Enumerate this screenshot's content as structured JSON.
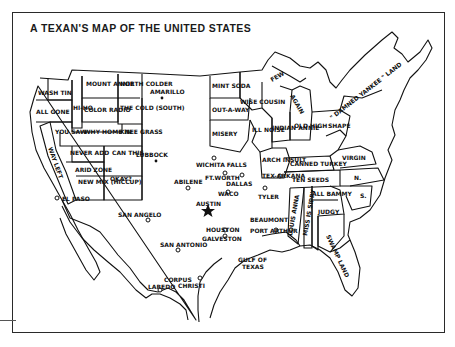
{
  "title": "A TEXAN'S MAP OF THE UNITED STATES",
  "regions": {
    "wash": "WASH TIN",
    "oregon": "ALL GONE",
    "california": "WAY LEFT",
    "california2": "WAY LEFT",
    "idaho": "HI-HO",
    "montana": "MOUNT ANNIE",
    "north_dakota": "NORTH COLDER",
    "south_dakota": "THE COLD (SOUTH)",
    "wyoming": "WHY HOME IN",
    "colorado": "COLOR RADIO",
    "nevada": "YOU SAW",
    "utah": "NEVER ADD",
    "nebraska": "KNEE GRASS",
    "kansas": "CAN THIS",
    "arizona": "ARID ZONE",
    "new_mexico": "NEW MIX (HICCUP)",
    "oklahoma": "OKAY?",
    "minnesota": "MINT SODA",
    "iowa": "OUT-A-WAY",
    "missouri": "MISERY",
    "wisconsin": "WISE COUSIN",
    "illinois": "ILL NOISE",
    "michigan_up": "FEW",
    "michigan": "MISS YOU",
    "michigan2": "AGAIN",
    "indiana": "INDIAN ANNIE",
    "ohio": "OLD HIGH",
    "arkansas": "ARCH INSULT",
    "kentucky": "CANNED TURKEY",
    "tennessee": "TEN SEEDS",
    "west_virginia": "W. VIRGIN",
    "pennsylvania": "SHAPE",
    "virginia": "VIRGIN",
    "virginia2": "IN",
    "nc": "N.",
    "carolina": "CAROLINE",
    "sc": "S.",
    "mississippi": "MISS IS SIPPY",
    "louisiana": "LOUIS ANNA",
    "alabama": "ALL BAMMY",
    "georgia": "JUDGY",
    "florida": "SWAMP LAND",
    "new_england": "\" DAMNED YANKEE \" LAND"
  },
  "cities": [
    {
      "name": "AMARILLO"
    },
    {
      "name": "LUBBOCK"
    },
    {
      "name": "WICHITA FALLS"
    },
    {
      "name": "FT.WORTH"
    },
    {
      "name": "DALLAS"
    },
    {
      "name": "ABILENE"
    },
    {
      "name": "WACO"
    },
    {
      "name": "TEX-ARKANA"
    },
    {
      "name": "TYLER"
    },
    {
      "name": "AUSTIN"
    },
    {
      "name": "EL PASO"
    },
    {
      "name": "SAN ANGELO"
    },
    {
      "name": "BEAUMONT"
    },
    {
      "name": "HOUSTON"
    },
    {
      "name": "PORT ARTHUR"
    },
    {
      "name": "GALVESTON"
    },
    {
      "name": "SAN ANTONIO"
    },
    {
      "name": "GULF OF"
    },
    {
      "name": "TEXAS"
    },
    {
      "name": "CORPUS"
    },
    {
      "name": "CHRISTI"
    },
    {
      "name": "LAREDO"
    }
  ]
}
